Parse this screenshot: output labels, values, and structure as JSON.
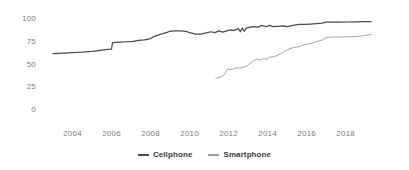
{
  "chart_data": {
    "type": "line",
    "title": "",
    "subtitle": "",
    "xlabel": "",
    "ylabel": "",
    "xlim": [
      2003,
      2019.4
    ],
    "ylim": [
      0,
      105
    ],
    "grid": false,
    "legend_position": "bottom-center",
    "yticks": [
      "0",
      "25",
      "50",
      "75",
      "100"
    ],
    "ytick_values": [
      0,
      25,
      50,
      75,
      100
    ],
    "xticks": [
      "2004",
      "2006",
      "2008",
      "2010",
      "2012",
      "2014",
      "2016",
      "2018"
    ],
    "xtick_values": [
      2004,
      2006,
      2008,
      2010,
      2012,
      2014,
      2016,
      2018
    ],
    "series": [
      {
        "name": "Cellphone",
        "color": "#4a4a4a",
        "x": [
          2003.0,
          2003.5,
          2004.0,
          2004.5,
          2005.0,
          2005.4,
          2005.8,
          2006.0,
          2006.05,
          2006.4,
          2006.8,
          2007.1,
          2007.4,
          2007.7,
          2008.0,
          2008.2,
          2008.5,
          2008.8,
          2009.0,
          2009.2,
          2009.5,
          2009.8,
          2010.0,
          2010.3,
          2010.6,
          2010.9,
          2011.1,
          2011.3,
          2011.5,
          2011.7,
          2011.9,
          2012.1,
          2012.3,
          2012.5,
          2012.6,
          2012.7,
          2012.8,
          2012.9,
          2013.1,
          2013.3,
          2013.5,
          2013.7,
          2013.9,
          2014.1,
          2014.3,
          2014.5,
          2014.8,
          2015.0,
          2015.3,
          2015.6,
          2015.9,
          2016.2,
          2016.5,
          2016.8,
          2017.0,
          2017.3,
          2017.7,
          2018.1,
          2018.5,
          2019.0,
          2019.3
        ],
        "y": [
          62,
          62.5,
          63,
          63.5,
          64.5,
          65.5,
          66.5,
          67,
          74,
          74.5,
          75,
          75.5,
          76.5,
          77,
          78.5,
          81,
          83,
          85,
          86.5,
          87,
          87,
          86.5,
          85,
          83.5,
          83.5,
          85,
          86,
          85,
          87,
          85.5,
          87,
          88,
          87.5,
          89.5,
          86,
          90,
          86.5,
          90,
          91,
          91.5,
          91,
          93,
          91.5,
          93,
          91.5,
          92,
          92.5,
          91.5,
          93,
          94,
          94,
          94.5,
          95,
          95.5,
          96.5,
          96.5,
          96.5,
          96.7,
          96.8,
          97,
          97
        ]
      },
      {
        "name": "Smartphone",
        "color": "#9a9a9a",
        "x": [
          2011.35,
          2011.6,
          2011.8,
          2011.9,
          2012.0,
          2012.1,
          2012.25,
          2012.4,
          2012.55,
          2012.7,
          2012.9,
          2013.0,
          2013.15,
          2013.3,
          2013.5,
          2013.65,
          2013.8,
          2013.95,
          2014.1,
          2014.3,
          2014.5,
          2014.7,
          2014.9,
          2015.1,
          2015.3,
          2015.6,
          2015.9,
          2016.2,
          2016.5,
          2016.8,
          2017.0,
          2017.2,
          2017.5,
          2017.9,
          2018.3,
          2018.7,
          2019.0,
          2019.3
        ],
        "y": [
          35,
          36,
          39,
          44,
          45,
          44.5,
          45,
          46.5,
          46,
          46.5,
          48,
          49.5,
          52,
          54.5,
          56,
          55,
          56.5,
          55.5,
          58,
          58.5,
          60,
          62,
          65,
          67,
          68.5,
          69.5,
          72,
          73,
          75,
          77,
          79.5,
          80,
          80.2,
          80.3,
          80.5,
          81,
          82,
          83
        ]
      }
    ]
  },
  "legend": {
    "items": [
      {
        "label": "Cellphone",
        "color": "#4a4a4a"
      },
      {
        "label": "Smartphone",
        "color": "#9a9a9a"
      }
    ]
  }
}
